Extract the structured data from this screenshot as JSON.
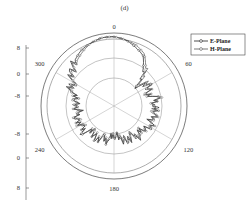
{
  "figure": {
    "panel_label": "(d)"
  },
  "chart_data": {
    "type": "polar-line",
    "title": "(d)",
    "legend": {
      "position": "upper-right",
      "entries": [
        {
          "name": "E-Plane",
          "marker": "circle-open",
          "color": "#222222"
        },
        {
          "name": "H-Plane",
          "marker": "circle-open",
          "color": "#555555"
        }
      ]
    },
    "angular_ticks": [
      0,
      60,
      120,
      180,
      240,
      300
    ],
    "angular_tick_labels": [
      "0",
      "60",
      "120",
      "180",
      "240",
      "300"
    ],
    "radial_axis_labels_top_to_bottom": [
      "8",
      "0",
      "-8",
      "-8",
      "0",
      "8"
    ],
    "radial_range": [
      -24,
      8
    ],
    "grid": true,
    "series": [
      {
        "name": "E-Plane",
        "theta_deg": [
          0,
          10,
          20,
          30,
          40,
          50,
          60,
          70,
          80,
          90,
          100,
          110,
          120,
          130,
          140,
          150,
          160,
          170,
          180,
          190,
          200,
          210,
          220,
          230,
          240,
          250,
          260,
          270,
          280,
          290,
          300,
          310,
          320,
          330,
          340,
          350
        ],
        "values_db": [
          7,
          6,
          4,
          2,
          -4,
          -10,
          -6,
          -8,
          -5,
          -6,
          -4,
          -7,
          -4,
          -9,
          -6,
          -8,
          -7,
          -9,
          -12,
          -8,
          -9,
          -7,
          -10,
          -6,
          -8,
          -5,
          -9,
          -6,
          -8,
          -3,
          -2,
          1,
          3,
          5,
          6,
          7
        ]
      },
      {
        "name": "H-Plane",
        "theta_deg": [
          0,
          10,
          20,
          30,
          40,
          50,
          60,
          70,
          80,
          90,
          100,
          110,
          120,
          130,
          140,
          150,
          160,
          170,
          180,
          190,
          200,
          210,
          220,
          230,
          240,
          250,
          260,
          270,
          280,
          290,
          300,
          310,
          320,
          330,
          340,
          350
        ],
        "values_db": [
          7,
          6,
          5,
          3,
          -2,
          -8,
          -5,
          -9,
          -4,
          -7,
          -5,
          -6,
          -5,
          -8,
          -7,
          -9,
          -8,
          -10,
          -11,
          -9,
          -8,
          -8,
          -9,
          -7,
          -7,
          -6,
          -8,
          -7,
          -7,
          -4,
          -3,
          0,
          2,
          4,
          6,
          7
        ]
      }
    ]
  }
}
